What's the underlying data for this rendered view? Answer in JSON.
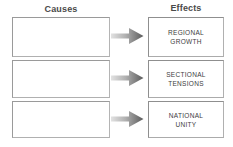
{
  "diagram": {
    "type": "cause-and-effect-organizer",
    "columns": {
      "causes_heading": "Causes",
      "effects_heading": "Effects"
    },
    "arrow": {
      "direction": "right",
      "icon": "right-arrow-icon",
      "gradient_from": "#d8d8d8",
      "gradient_to": "#5e5e5e"
    },
    "colors": {
      "heading_text": "#4a4a4a",
      "box_border": "#929292",
      "box_fill": "#ffffff",
      "effect_text": "#3d3d3d",
      "page_background": "#ffffff"
    },
    "rows": [
      {
        "cause": "",
        "effect_lines": [
          "REGIONAL",
          "GROWTH"
        ]
      },
      {
        "cause": "",
        "effect_lines": [
          "SECTIONAL",
          "TENSIONS"
        ]
      },
      {
        "cause": "",
        "effect_lines": [
          "NATIONAL",
          "UNITY"
        ]
      }
    ]
  }
}
